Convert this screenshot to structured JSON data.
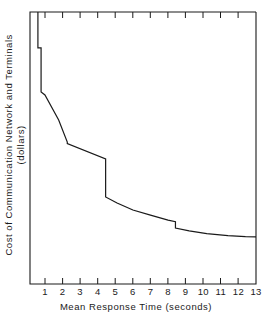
{
  "chart_data": {
    "type": "line",
    "title": "",
    "xlabel": "Mean Response Time (seconds)",
    "ylabel_line1": "Cost of Communication Network and Terminals",
    "ylabel_line2": "(dollars)",
    "xlim": [
      0.15,
      13.0
    ],
    "ylim": [
      0,
      100
    ],
    "grid": false,
    "legend": null,
    "xticks": [
      1,
      2,
      3,
      4,
      5,
      6,
      7,
      8,
      9,
      10,
      11,
      12,
      13
    ],
    "xtick_labels": [
      "1",
      "2",
      "3",
      "4",
      "5",
      "6",
      "7",
      "8",
      "9",
      "10",
      "11",
      "12",
      "13"
    ],
    "ytick_labels": [],
    "series": [
      {
        "name": "cost-curve",
        "note": "Monotonically decreasing step/decay curve; y in arbitrary dollar units read off the unlabeled axis (0-100 scale, top of frame = 100, bottom = 0).",
        "x": [
          0.6,
          0.6,
          0.78,
          0.78,
          1.0,
          1.78,
          1.78,
          2.27,
          2.27,
          4.45,
          4.45,
          5.1,
          6.0,
          7.0,
          8.0,
          8.42,
          8.42,
          9.2,
          10.2,
          11.4,
          12.4,
          13.0
        ],
        "y": [
          100.0,
          86.8,
          86.8,
          70.6,
          69.5,
          60.3,
          60.3,
          52.2,
          51.6,
          46.0,
          32.0,
          29.8,
          27.2,
          25.3,
          23.5,
          22.9,
          20.6,
          19.5,
          18.5,
          17.8,
          17.4,
          17.3
        ]
      }
    ],
    "steps": [
      {
        "at_x": 0.6,
        "from_y": 100.0,
        "to_y": 86.8
      },
      {
        "at_x": 0.78,
        "from_y": 86.8,
        "to_y": 70.6
      },
      {
        "at_x": 1.78,
        "from_y": 60.3,
        "to_y": 60.3
      },
      {
        "at_x": 2.27,
        "from_y": 52.2,
        "to_y": 51.6
      },
      {
        "at_x": 4.45,
        "from_y": 46.0,
        "to_y": 32.0
      },
      {
        "at_x": 8.42,
        "from_y": 22.9,
        "to_y": 20.6
      }
    ]
  },
  "axes": {
    "frame_color": "#1a1a1a",
    "line_color": "#1a1a1a"
  }
}
